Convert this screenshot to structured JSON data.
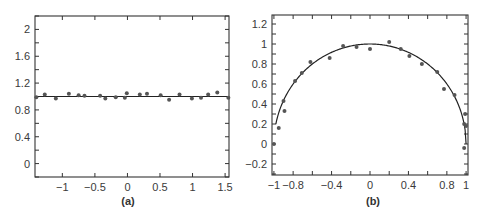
{
  "chart_data": [
    {
      "id": "a",
      "type": "scatter",
      "caption": "(a)",
      "title": "",
      "xlabel": "",
      "ylabel": "",
      "xlim": [
        -1.42,
        1.56
      ],
      "ylim": [
        -0.2,
        2.2
      ],
      "xticks": [
        -1,
        -0.5,
        0,
        0.5,
        1,
        1.5
      ],
      "xtick_labels": [
        "−1",
        "−0.5",
        "0",
        "0.5",
        "1",
        "1.5"
      ],
      "yticks": [
        0,
        0.4,
        0.8,
        1.2,
        1.6,
        2
      ],
      "ytick_labels": [
        "0",
        "0.4",
        "0.8",
        "1.2",
        "1.6",
        "2"
      ],
      "grid": false,
      "legend": null,
      "series": [
        {
          "name": "fit",
          "kind": "line",
          "x": [
            -1.42,
            1.56
          ],
          "y": [
            1.0,
            1.0
          ]
        },
        {
          "name": "data",
          "kind": "points",
          "x": [
            -1.4,
            -1.27,
            -1.1,
            -0.9,
            -0.75,
            -0.66,
            -0.42,
            -0.34,
            -0.18,
            -0.04,
            -0.01,
            0.19,
            0.3,
            0.51,
            0.64,
            0.8,
            0.99,
            1.13,
            1.24,
            1.38,
            1.55
          ],
          "y": [
            0.99,
            1.03,
            0.97,
            1.04,
            1.02,
            1.01,
            1.01,
            0.97,
            0.99,
            0.98,
            1.05,
            1.03,
            1.04,
            1.02,
            0.95,
            1.03,
            0.97,
            0.98,
            1.03,
            1.06,
            0.98
          ]
        }
      ]
    },
    {
      "id": "b",
      "type": "scatter",
      "caption": "(b)",
      "title": "",
      "xlabel": "",
      "ylabel": "",
      "xlim": [
        -1.02,
        1.02
      ],
      "ylim": [
        -0.31,
        1.29
      ],
      "xticks": [
        -1,
        -0.8,
        -0.4,
        0,
        0.4,
        0.8,
        1
      ],
      "xtick_labels": [
        "−1",
        "−0.8",
        "−0.4",
        "0",
        "0.4",
        "0.8",
        "1"
      ],
      "xminor_ticks": [
        -0.6,
        -0.2,
        0.2,
        0.6
      ],
      "yticks": [
        -0.2,
        0,
        0.2,
        0.4,
        0.6,
        0.8,
        1,
        1.2
      ],
      "ytick_labels": [
        "−0.2",
        "0",
        "0.2",
        "0.4",
        "0.6",
        "0.8",
        "1",
        "1.2"
      ],
      "grid": false,
      "legend": null,
      "series": [
        {
          "name": "fit",
          "kind": "line",
          "function": "y = sqrt(1 - x^2)",
          "domain": [
            -0.98,
            1.0
          ]
        },
        {
          "name": "data",
          "kind": "points",
          "x": [
            -1.0,
            -0.95,
            -0.9,
            -0.89,
            -0.78,
            -0.71,
            -0.62,
            -0.42,
            -0.28,
            -0.14,
            0.0,
            0.2,
            0.32,
            0.41,
            0.54,
            0.7,
            0.77,
            0.88,
            0.98,
            0.99,
            1.0,
            0.98
          ],
          "y": [
            0.0,
            0.16,
            0.43,
            0.33,
            0.63,
            0.71,
            0.82,
            0.86,
            0.98,
            0.97,
            0.95,
            1.02,
            0.95,
            0.88,
            0.8,
            0.72,
            0.55,
            0.49,
            0.2,
            0.3,
            0.18,
            -0.04
          ]
        }
      ]
    }
  ]
}
